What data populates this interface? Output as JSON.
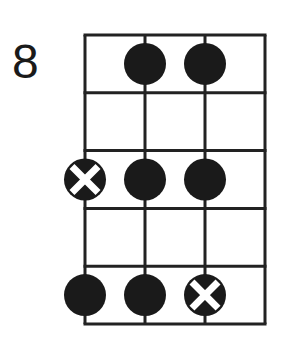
{
  "diagram": {
    "fret_label": "8",
    "strings": 4,
    "frets": 5,
    "colors": {
      "line": "#222222",
      "dot": "#1a1a1a",
      "root_mark": "#ffffff",
      "background": "#ffffff"
    },
    "grid": {
      "left": 85,
      "top": 35,
      "string_spacing": 60,
      "fret_spacing": 57.8
    },
    "dot_radius": 21,
    "notes": [
      {
        "string": 2,
        "fret": 1,
        "type": "dot"
      },
      {
        "string": 3,
        "fret": 1,
        "type": "dot"
      },
      {
        "string": 1,
        "fret": 3,
        "type": "root"
      },
      {
        "string": 2,
        "fret": 3,
        "type": "dot"
      },
      {
        "string": 3,
        "fret": 3,
        "type": "dot"
      },
      {
        "string": 1,
        "fret": 5,
        "type": "dot"
      },
      {
        "string": 2,
        "fret": 5,
        "type": "dot"
      },
      {
        "string": 3,
        "fret": 5,
        "type": "root"
      }
    ]
  }
}
